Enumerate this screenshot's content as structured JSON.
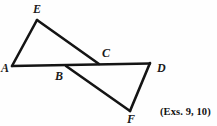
{
  "figure": {
    "background_color": "#fefefe",
    "stroke_color": "#141414",
    "label_color": "#1a1a1a",
    "width": 217,
    "height": 126,
    "points": {
      "A": {
        "x": 12,
        "y": 66
      },
      "B": {
        "x": 66,
        "y": 66
      },
      "C": {
        "x": 99,
        "y": 64
      },
      "D": {
        "x": 150,
        "y": 63
      },
      "E": {
        "x": 37,
        "y": 20
      },
      "F": {
        "x": 130,
        "y": 111
      }
    },
    "segments": [
      {
        "name": "segment-A-E",
        "from": "A",
        "to": "E",
        "width": 2.6
      },
      {
        "name": "segment-E-C",
        "from": "E",
        "to": "C",
        "width": 2.6
      },
      {
        "name": "segment-A-D",
        "from": "A",
        "to": "D",
        "width": 2.4
      },
      {
        "name": "segment-B-F",
        "from": "B",
        "to": "F",
        "width": 2.6
      },
      {
        "name": "segment-F-D",
        "from": "F",
        "to": "D",
        "width": 2.6
      }
    ],
    "labels": [
      {
        "name": "vertex-label-E",
        "text": "E",
        "x": 33,
        "y": 3
      },
      {
        "name": "vertex-label-A",
        "text": "A",
        "x": 1,
        "y": 62
      },
      {
        "name": "vertex-label-B",
        "text": "B",
        "x": 55,
        "y": 70
      },
      {
        "name": "vertex-label-C",
        "text": "C",
        "x": 102,
        "y": 47
      },
      {
        "name": "vertex-label-D",
        "text": "D",
        "x": 157,
        "y": 62
      },
      {
        "name": "vertex-label-F",
        "text": "F",
        "x": 127,
        "y": 113
      }
    ],
    "caption": {
      "text": "(Exs. 9, 10)",
      "x": 160,
      "y": 107
    }
  }
}
